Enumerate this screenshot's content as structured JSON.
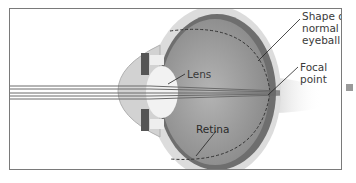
{
  "diagram": {
    "labels": {
      "lens": "Lens",
      "shape_normal": "Shape of\nnormal\neyeball",
      "focal_point": "Focal\npoint",
      "retina": "Retina"
    },
    "colors": {
      "frame": "#7a7a7a",
      "sclera": "#d6d6d6",
      "choroid": "#6e6e6e",
      "vitreous": "#9c9c9c",
      "lens": "#f2f2f2",
      "rays": "#6a6a6a",
      "marker": "#9a9a9a"
    }
  }
}
